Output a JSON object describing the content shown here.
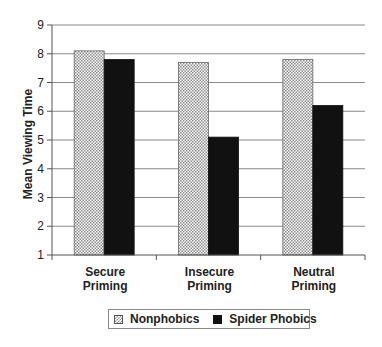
{
  "chart_data": {
    "type": "bar",
    "title": "",
    "xlabel": "",
    "ylabel": "Mean Viewing Time",
    "ylim": [
      1,
      9
    ],
    "yticks": [
      1,
      2,
      3,
      4,
      5,
      6,
      7,
      8,
      9
    ],
    "grid": true,
    "legend_position": "bottom",
    "categories": [
      [
        "Secure",
        "Priming"
      ],
      [
        "Insecure",
        "Priming"
      ],
      [
        "Neutral",
        "Priming"
      ]
    ],
    "series": [
      {
        "name": "Nonphobics",
        "pattern": "checker-hatch",
        "values": [
          8.1,
          7.7,
          7.8
        ]
      },
      {
        "name": "Spider Phobics",
        "pattern": "solid",
        "color": "#111111",
        "values": [
          7.8,
          5.1,
          6.2
        ]
      }
    ]
  },
  "colors": {
    "axis": "#555555",
    "grid": "#8a8a8a",
    "hatch": "#8c8c8c",
    "solid": "#111111"
  }
}
